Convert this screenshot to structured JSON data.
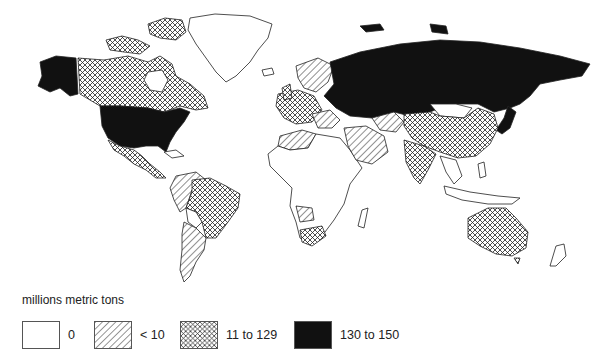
{
  "map": {
    "type": "choropleth",
    "projection": "world (Miller-like)",
    "colors": {
      "background": "#ffffff",
      "outline": "#222222",
      "fill_dark": "#111111"
    },
    "categories": {
      "zero": [
        "Greenland",
        "Central/West Africa (most)",
        "Bolivia",
        "Paraguay",
        "Uruguay",
        "Mongolia",
        "Southeast Asia (most)",
        "Pacific islands"
      ],
      "lt10": [
        "Western South America",
        "Argentina",
        "Chile",
        "North Africa",
        "Middle East",
        "Scandinavia",
        "Southern Europe",
        "Kazakhstan region",
        "Angola/Zambia region"
      ],
      "11to129": [
        "Canada",
        "Mexico",
        "Brazil",
        "Western Europe",
        "China",
        "India",
        "Australia",
        "South Africa",
        "Turkey"
      ],
      "130to150": [
        "United States",
        "Alaska",
        "Russia / Former USSR"
      ]
    }
  },
  "legend": {
    "title": "millions metric tons",
    "items": [
      {
        "label": "0",
        "pattern": "blank"
      },
      {
        "label": "< 10",
        "pattern": "diagonal-hatch"
      },
      {
        "label": "11 to 129",
        "pattern": "crosshatch"
      },
      {
        "label": "130 to 150",
        "pattern": "solid-black"
      }
    ]
  }
}
